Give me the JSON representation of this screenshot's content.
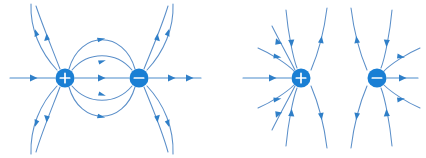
{
  "figure": {
    "width": 426,
    "height": 158,
    "background": "#ffffff",
    "colors": {
      "charge_fill": "#1a7fd4",
      "charge_glyph": "#ffffff",
      "field_line": "#5b8fc9",
      "axis_line": "#4a8ccc",
      "arrow": "#2f7fc8"
    }
  },
  "panels": [
    {
      "id": "left-panel",
      "name": "electric-dipole-diagram",
      "description": "Electric dipole: field lines emanate from the positive charge and terminate on the negative charge",
      "charges": [
        {
          "id": "left-positive",
          "sign": "+",
          "label": "positive-charge",
          "cx": 65,
          "cy": 78,
          "r": 9.5
        },
        {
          "id": "left-negative",
          "sign": "−",
          "label": "negative-charge",
          "cx": 139,
          "cy": 78,
          "r": 9.5
        }
      ],
      "field_line_count": 11,
      "arrow_direction": "from positive toward negative"
    },
    {
      "id": "right-panel",
      "name": "like-charge-field-diagram",
      "description": "Second configuration: field lines converge inward at the positive charge and sweep away vertically between the charges",
      "charges": [
        {
          "id": "right-positive",
          "sign": "+",
          "label": "positive-charge",
          "cx": 301,
          "cy": 78,
          "r": 9.5
        },
        {
          "id": "right-negative",
          "sign": "−",
          "label": "negative-charge",
          "cx": 377,
          "cy": 78,
          "r": 9.5
        }
      ],
      "field_line_count": 14,
      "arrow_direction": "inward toward positive charge, outward from negative charge"
    }
  ],
  "chart_data": {
    "type": "diagram",
    "xlabel": "",
    "ylabel": "",
    "panels": [
      {
        "name": "Electric dipole",
        "charges": [
          {
            "sign": "+",
            "x": 65,
            "y": 78
          },
          {
            "sign": "−",
            "x": 139,
            "y": 78
          }
        ],
        "lines": 11
      },
      {
        "name": "Second configuration",
        "charges": [
          {
            "sign": "+",
            "x": 301,
            "y": 78
          },
          {
            "sign": "−",
            "x": 377,
            "y": 78
          }
        ],
        "lines": 14
      }
    ]
  }
}
